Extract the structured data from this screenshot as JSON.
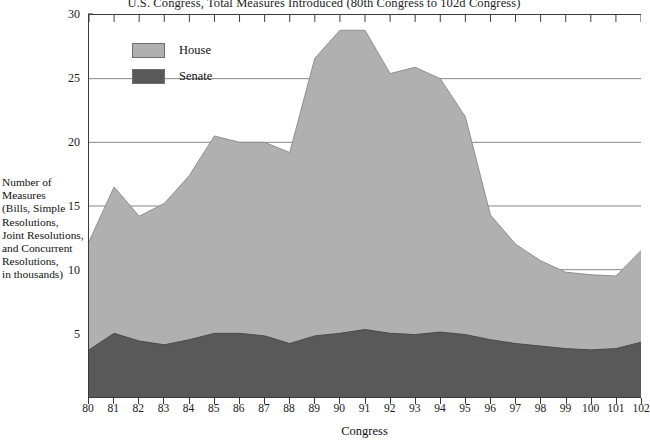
{
  "chart_data": {
    "type": "area",
    "stacked": true,
    "title": "U.S. Congress, Total Measures Introduced (80th Congress to 102d Congress)",
    "xlabel": "Congress",
    "ylabel_lines": [
      "Number of",
      "Measures",
      "(Bills, Simple",
      "Resolutions,",
      "Joint Resolutions,",
      "and Concurrent",
      "Resolutions,",
      "in thousands)"
    ],
    "categories": [
      "80",
      "81",
      "82",
      "83",
      "84",
      "85",
      "86",
      "87",
      "88",
      "89",
      "90",
      "91",
      "92",
      "93",
      "94",
      "95",
      "96",
      "97",
      "98",
      "99",
      "100",
      "101",
      "102"
    ],
    "x": [
      80,
      81,
      82,
      83,
      84,
      85,
      86,
      87,
      88,
      89,
      90,
      91,
      92,
      93,
      94,
      95,
      96,
      97,
      98,
      99,
      100,
      101,
      102
    ],
    "series": [
      {
        "name": "Senate",
        "color": "#595959",
        "values": [
          3.7,
          5.0,
          4.4,
          4.1,
          4.5,
          5.0,
          5.0,
          4.8,
          4.2,
          4.8,
          5.0,
          5.3,
          5.0,
          4.9,
          5.1,
          4.9,
          4.5,
          4.2,
          4.0,
          3.8,
          3.7,
          3.8,
          4.3
        ]
      },
      {
        "name": "House",
        "color": "#b0b0b0",
        "values": [
          8.5,
          11.5,
          9.8,
          11.1,
          12.9,
          15.5,
          15.0,
          15.2,
          15.0,
          21.8,
          23.8,
          23.5,
          20.4,
          21.0,
          19.9,
          17.1,
          9.8,
          7.8,
          6.7,
          6.0,
          5.9,
          5.7,
          7.2
        ]
      }
    ],
    "totals": [
      12.2,
      16.5,
      14.2,
      15.2,
      17.4,
      20.5,
      20.0,
      20.0,
      19.2,
      26.6,
      28.8,
      28.8,
      25.4,
      25.9,
      25.0,
      22.0,
      14.3,
      12.0,
      10.7,
      9.8,
      9.6,
      9.5,
      11.5
    ],
    "yticks": [
      5,
      10,
      15,
      20,
      25,
      30
    ],
    "ylim": [
      0,
      30
    ],
    "xlim": [
      80,
      102
    ],
    "grid": true,
    "legend_position": "top-left",
    "legend": [
      "House",
      "Senate"
    ]
  },
  "legend": {
    "house_label": "House",
    "senate_label": "Senate"
  },
  "axes": {
    "x_title": "Congress"
  }
}
